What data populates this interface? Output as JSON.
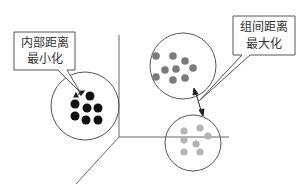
{
  "diagram": {
    "type": "clustering-concept",
    "callouts": {
      "intra": {
        "line1": "内部距离",
        "line2": "最小化"
      },
      "inter": {
        "line1": "组间距离",
        "line2": "最大化"
      }
    },
    "clusters": [
      {
        "name": "cluster-left",
        "dot_color": "#111111",
        "dot_count": 7
      },
      {
        "name": "cluster-top-right",
        "dot_color": "#7a7a7a",
        "dot_count": 9
      },
      {
        "name": "cluster-bottom-right",
        "dot_color": "#b3b3b3",
        "dot_count": 7
      }
    ],
    "colors": {
      "line": "#555555",
      "background": "#ffffff"
    }
  }
}
